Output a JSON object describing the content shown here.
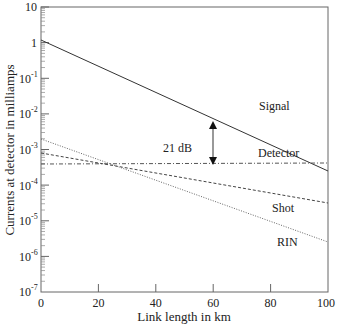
{
  "chart_data": {
    "type": "line",
    "title": "",
    "xlabel": "Link length in km",
    "ylabel": "Currents at detector in milliamps",
    "xlim": [
      0,
      100
    ],
    "ylim": [
      1e-07,
      10
    ],
    "yscale": "log",
    "x_ticks": [
      "0",
      "20",
      "40",
      "60",
      "80",
      "100"
    ],
    "y_ticks": [
      "10",
      "1",
      "10-1",
      "10-2",
      "10-3",
      "10-4",
      "10-5",
      "10-6",
      "10-7"
    ],
    "grid": false,
    "series": [
      {
        "name": "Signal",
        "style": "solid",
        "x": [
          0,
          100
        ],
        "values": [
          1.2,
          0.013
        ]
      },
      {
        "name": "Detector",
        "style": "dash-dot",
        "x": [
          0,
          100
        ],
        "values": [
          0.0004,
          0.00045
        ]
      },
      {
        "name": "Shot",
        "style": "dashed",
        "x": [
          0,
          100
        ],
        "values": [
          0.0008,
          3e-05
        ]
      },
      {
        "name": "RIN",
        "style": "dotted",
        "x": [
          0,
          100
        ],
        "values": [
          0.002,
          2.5e-05
        ]
      }
    ],
    "annotations": [
      {
        "text": "21 dB",
        "x": 60,
        "from": 0.0045,
        "to": 0.0004,
        "type": "double-arrow"
      }
    ]
  },
  "labels": {
    "signal": "Signal",
    "detector": "Detector",
    "shot": "Shot",
    "rin": "RIN",
    "annotation": "21 dB",
    "xlabel": "Link length in km",
    "ylabel": "Currents at detector in milliamps"
  },
  "xticks": [
    "0",
    "20",
    "40",
    "60",
    "80",
    "100"
  ],
  "yticks": {
    "t10": "10",
    "t1": "1",
    "e1": "-1",
    "e2": "-2",
    "e3": "-3",
    "e4": "-4",
    "e5": "-5",
    "e6": "-6",
    "e7": "-7",
    "base": "10"
  }
}
